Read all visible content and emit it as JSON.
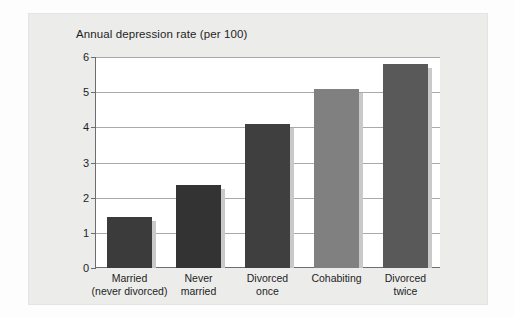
{
  "chart_data": {
    "type": "bar",
    "title": "Annual depression rate (per 100)",
    "xlabel": "",
    "ylabel": "",
    "ylim": [
      0,
      6
    ],
    "ytick_step": 1,
    "yticks": [
      "6",
      "5",
      "4",
      "3",
      "2",
      "1",
      "0"
    ],
    "grid": true,
    "legend": "none",
    "categories": [
      "Married\n(never divorced)",
      "Never\nmarried",
      "Divorced\nonce",
      "Cohabiting",
      "Divorced\ntwice"
    ],
    "category_lines": [
      [
        "Married",
        "(never divorced)"
      ],
      [
        "Never",
        "married"
      ],
      [
        "Divorced",
        "once"
      ],
      [
        "Cohabiting",
        ""
      ],
      [
        "Divorced",
        "twice"
      ]
    ],
    "values": [
      1.45,
      2.35,
      4.1,
      5.1,
      5.8
    ],
    "bar_colors": [
      "#3b3b3b",
      "#333333",
      "#3f3f3f",
      "#808080",
      "#595959"
    ]
  },
  "colors": {
    "panel_background": "#ececeb",
    "plot_background": "#ffffff",
    "gridline": "#a9a9a9",
    "axis": "#6d6d6d",
    "text": "#1e1e1e",
    "bar_shadow": "#c9c9c9"
  }
}
